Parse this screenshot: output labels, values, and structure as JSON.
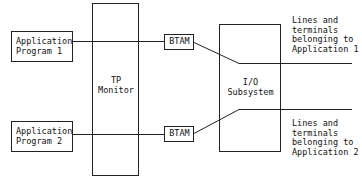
{
  "diagram": {
    "nodes": {
      "app1": {
        "line1": "Application",
        "line2": "Program 1"
      },
      "app2": {
        "line1": "Application",
        "line2": "Program 2"
      },
      "tp": {
        "line1": "TP",
        "line2": "Monitor"
      },
      "btam1": {
        "label": "BTAM"
      },
      "btam2": {
        "label": "BTAM"
      },
      "io": {
        "line1": "I/O",
        "line2": "Subsystem"
      }
    },
    "annotations": {
      "top": [
        "Lines and",
        "terminals",
        "belonging to",
        "Application 1"
      ],
      "bottom": [
        "Lines and",
        "terminals",
        "belonging to",
        "Application 2"
      ]
    },
    "colors": {
      "stroke": "#222222",
      "background": "#ffffff"
    }
  }
}
